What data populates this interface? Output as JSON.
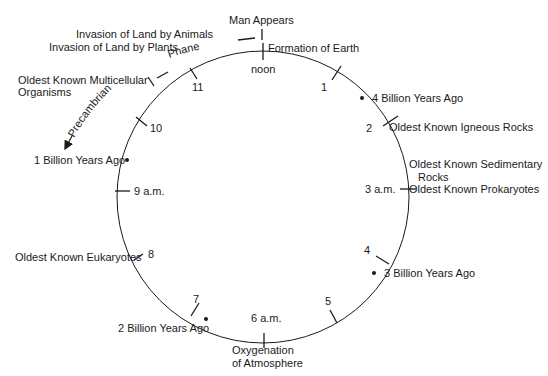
{
  "colors": {
    "ink": "#1a1a1a",
    "background": "#ffffff"
  },
  "clock": {
    "hours": [
      {
        "label": "noon",
        "hour": 0
      },
      {
        "label": "1",
        "hour": 1
      },
      {
        "label": "2",
        "hour": 2
      },
      {
        "label": "3 a.m.",
        "hour": 3
      },
      {
        "label": "4",
        "hour": 4
      },
      {
        "label": "5",
        "hour": 5
      },
      {
        "label": "6 a.m.",
        "hour": 6
      },
      {
        "label": "7",
        "hour": 7
      },
      {
        "label": "8",
        "hour": 8
      },
      {
        "label": "9 a.m.",
        "hour": 9
      },
      {
        "label": "10",
        "hour": 10
      },
      {
        "label": "11",
        "hour": 11
      }
    ],
    "time_points": [
      {
        "label": "4 Billion Years Ago"
      },
      {
        "label": "3 Billion Years Ago"
      },
      {
        "label": "2 Billion Years Ago"
      },
      {
        "label": "1 Billion Years Ago"
      }
    ]
  },
  "events": {
    "man_appears": "Man Appears",
    "formation_of_earth": "Formation of Earth",
    "igneous_rocks": "Oldest Known Igneous Rocks",
    "sedimentary_rocks_line1": "Oldest Known Sedimentary",
    "sedimentary_rocks_line2": "Rocks",
    "prokaryotes": "Oldest Known Prokaryotes",
    "oxygenation_line1": "Oxygenation",
    "oxygenation_line2": "of Atmosphere",
    "eukaryotes": "Oldest Known Eukaryotes",
    "multicellular_line1": "Oldest Known Multicellular",
    "multicellular_line2": "Organisms",
    "land_animals": "Invasion of Land by Animals",
    "land_plants": "Invasion of Land by Plants"
  },
  "eons": {
    "precambrian": "Precambrian",
    "phanerozoic": "Phanerozoic"
  }
}
